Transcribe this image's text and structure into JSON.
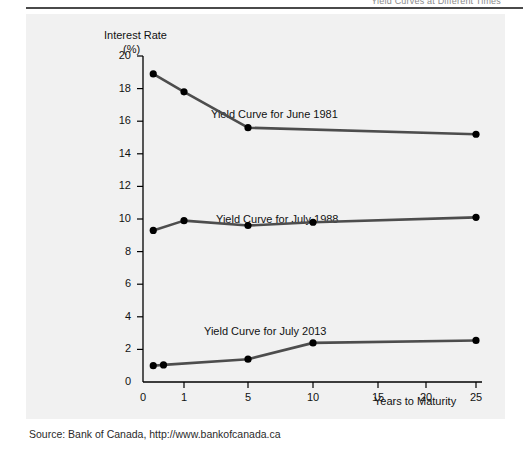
{
  "page": {
    "running_head": "Yield Curves at Different Times"
  },
  "figure": {
    "source_text": "Source: Bank of Canada, http://www.bankofcanada.ca"
  },
  "chart_data": {
    "type": "line",
    "title": "",
    "xlabel": "Years to Maturity",
    "ylabel": "Interest Rate",
    "ylabel_unit": "(%)",
    "ylim": [
      0,
      20
    ],
    "yticks": [
      0,
      2,
      4,
      6,
      8,
      10,
      12,
      14,
      16,
      18,
      20
    ],
    "xticks": [
      0,
      1,
      5,
      10,
      15,
      20,
      25
    ],
    "x_scale": "nonlinear-maturity",
    "grid": false,
    "legend": "inline-labels",
    "line_color": "#4d4d4d",
    "marker_color": "#000000",
    "series": [
      {
        "name": "Yield Curve for June 1981",
        "x": [
          0.25,
          1,
          5,
          25
        ],
        "values": [
          18.9,
          17.8,
          15.6,
          15.2
        ]
      },
      {
        "name": "Yield Curve for July 1988",
        "x": [
          0.25,
          1,
          5,
          10,
          25
        ],
        "values": [
          9.3,
          9.9,
          9.6,
          9.8,
          10.1
        ]
      },
      {
        "name": "Yield Curve for July 2013",
        "x": [
          0.25,
          0.5,
          5,
          10,
          25
        ],
        "values": [
          1.0,
          1.05,
          1.4,
          2.4,
          2.55
        ]
      }
    ]
  }
}
